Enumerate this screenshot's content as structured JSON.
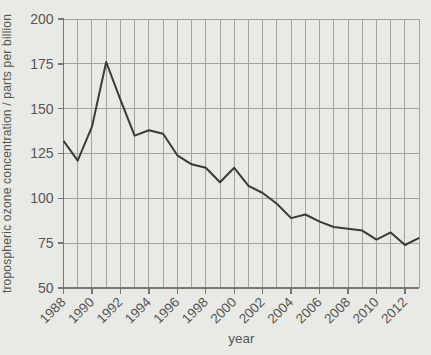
{
  "figure": {
    "background": "#e9e9e6",
    "text_color": "#565654",
    "grid_color": "#a2a2a0",
    "axis_color": "#777775",
    "line_color": "#3a3a38"
  },
  "chart_data": {
    "type": "line",
    "title": "",
    "xlabel": "year",
    "ylabel": "tropospheric ozone concentration / parts per billion",
    "xlim": [
      1988,
      2013
    ],
    "ylim": [
      50,
      200
    ],
    "yticks": [
      50,
      75,
      100,
      125,
      150,
      175,
      200
    ],
    "xticks_labeled": [
      1988,
      1990,
      1992,
      1994,
      1996,
      1998,
      2000,
      2002,
      2004,
      2006,
      2008,
      2010,
      2012
    ],
    "grid": true,
    "legend": false,
    "x": [
      1988,
      1989,
      1990,
      1991,
      1992,
      1993,
      1994,
      1995,
      1996,
      1997,
      1998,
      1999,
      2000,
      2001,
      2002,
      2003,
      2004,
      2005,
      2006,
      2007,
      2008,
      2009,
      2010,
      2011,
      2012,
      2013
    ],
    "y": [
      132,
      121,
      140,
      176,
      155,
      135,
      138,
      136,
      124,
      119,
      117,
      109,
      117,
      107,
      103,
      97,
      89,
      91,
      87,
      84,
      83,
      82,
      77,
      81,
      74,
      78
    ]
  }
}
